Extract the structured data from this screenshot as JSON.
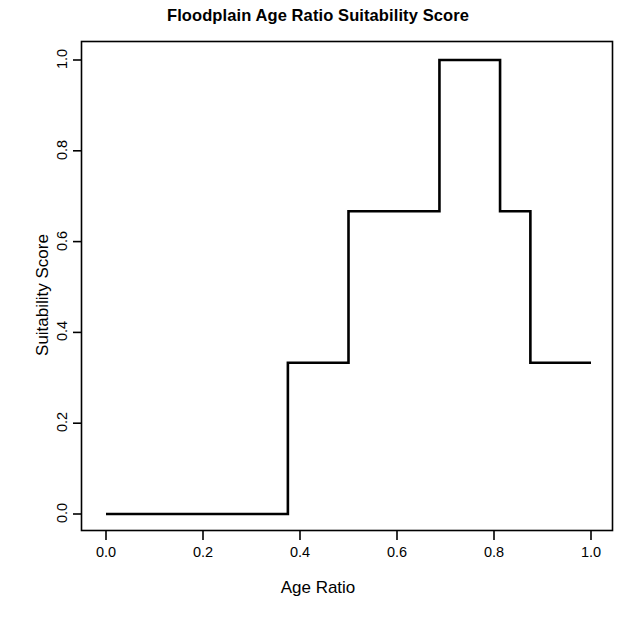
{
  "chart_data": {
    "type": "line",
    "subtype": "step",
    "title": "Floodplain Age Ratio Suitability Score",
    "xlabel": "Age Ratio",
    "ylabel": "Suitability Score",
    "xlim": [
      -0.05,
      1.03
    ],
    "ylim": [
      -0.035,
      1.04
    ],
    "xticks": [
      0.0,
      0.2,
      0.4,
      0.6,
      0.8,
      1.0
    ],
    "xticklabels": [
      "0.0",
      "0.2",
      "0.4",
      "0.6",
      "0.8",
      "1.0"
    ],
    "yticks": [
      0.0,
      0.2,
      0.4,
      0.6,
      0.8,
      1.0
    ],
    "yticklabels": [
      "0.0",
      "0.2",
      "0.4",
      "0.6",
      "0.8",
      "1.0"
    ],
    "grid": false,
    "legend": null,
    "line_color": "#000000",
    "line_width": 2.6,
    "breakpoints": [
      0.0,
      0.375,
      0.5,
      0.6875,
      0.8125,
      0.875,
      1.0
    ],
    "levels": [
      0.0,
      0.333,
      0.667,
      1.0,
      0.667,
      0.333
    ],
    "points": [
      {
        "x": 0.0,
        "y": 0.0
      },
      {
        "x": 0.375,
        "y": 0.0
      },
      {
        "x": 0.375,
        "y": 0.333
      },
      {
        "x": 0.5,
        "y": 0.333
      },
      {
        "x": 0.5,
        "y": 0.667
      },
      {
        "x": 0.6875,
        "y": 0.667
      },
      {
        "x": 0.6875,
        "y": 1.0
      },
      {
        "x": 0.8125,
        "y": 1.0
      },
      {
        "x": 0.8125,
        "y": 0.667
      },
      {
        "x": 0.875,
        "y": 0.667
      },
      {
        "x": 0.875,
        "y": 0.333
      },
      {
        "x": 1.0,
        "y": 0.333
      }
    ],
    "segments": [
      {
        "x_start": 0.0,
        "x_end": 0.375,
        "value": 0.0
      },
      {
        "x_start": 0.375,
        "x_end": 0.5,
        "value": 0.333
      },
      {
        "x_start": 0.5,
        "x_end": 0.6875,
        "value": 0.667
      },
      {
        "x_start": 0.6875,
        "x_end": 0.8125,
        "value": 1.0
      },
      {
        "x_start": 0.8125,
        "x_end": 0.875,
        "value": 0.667
      },
      {
        "x_start": 0.875,
        "x_end": 1.0,
        "value": 0.333
      }
    ]
  }
}
